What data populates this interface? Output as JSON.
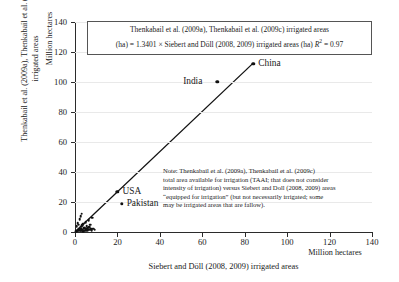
{
  "chart_data": {
    "type": "scatter",
    "title": "",
    "xlabel": "Siebert and Döll (2008, 2009) irrigated areas",
    "ylabel": "Thenkabail et al. (2009a), Thenkabail et al. (2009b) irrigated areas",
    "x_unit": "Million hectares",
    "y_unit": "Million hectares",
    "xlim": [
      0,
      140
    ],
    "ylim": [
      0,
      140
    ],
    "xticks": [
      0,
      20,
      40,
      60,
      80,
      100,
      120,
      140
    ],
    "yticks": [
      0,
      20,
      40,
      60,
      80,
      100,
      120,
      140
    ],
    "grid": "horizontal",
    "legend": "none",
    "regression": {
      "slope": 1.3401,
      "intercept": 0,
      "r_squared": 0.97,
      "line_from": [
        0,
        0
      ],
      "line_to": [
        84,
        112.6
      ]
    },
    "labeled_points": [
      {
        "name": "China",
        "x": 84,
        "y": 112,
        "label_side": "right"
      },
      {
        "name": "India",
        "x": 67,
        "y": 100,
        "label_side": "left"
      },
      {
        "name": "USA",
        "x": 20,
        "y": 27,
        "label_side": "right"
      },
      {
        "name": "Pakistan",
        "x": 22,
        "y": 19,
        "label_side": "right"
      }
    ],
    "unlabeled_points": [
      {
        "x": 1.0,
        "y": 1.0
      },
      {
        "x": 1.5,
        "y": 1.6
      },
      {
        "x": 2.0,
        "y": 2.2
      },
      {
        "x": 2.4,
        "y": 1.2
      },
      {
        "x": 2.8,
        "y": 3.4
      },
      {
        "x": 3.0,
        "y": 2.0
      },
      {
        "x": 3.4,
        "y": 4.6
      },
      {
        "x": 3.6,
        "y": 1.4
      },
      {
        "x": 4.0,
        "y": 5.4
      },
      {
        "x": 4.2,
        "y": 2.6
      },
      {
        "x": 4.6,
        "y": 3.0
      },
      {
        "x": 5.0,
        "y": 6.6
      },
      {
        "x": 5.2,
        "y": 1.8
      },
      {
        "x": 5.6,
        "y": 4.0
      },
      {
        "x": 6.0,
        "y": 2.4
      },
      {
        "x": 6.4,
        "y": 8.0
      },
      {
        "x": 6.8,
        "y": 3.2
      },
      {
        "x": 7.2,
        "y": 5.0
      },
      {
        "x": 7.6,
        "y": 2.0
      },
      {
        "x": 8.0,
        "y": 9.4
      },
      {
        "x": 2.2,
        "y": 8.4
      },
      {
        "x": 2.6,
        "y": 10.4
      },
      {
        "x": 3.2,
        "y": 12.2
      },
      {
        "x": 1.2,
        "y": 6.0
      },
      {
        "x": 0.8,
        "y": 3.8
      },
      {
        "x": 1.8,
        "y": 4.8
      },
      {
        "x": 4.8,
        "y": 1.0
      },
      {
        "x": 5.8,
        "y": 1.2
      },
      {
        "x": 6.6,
        "y": 1.6
      },
      {
        "x": 7.8,
        "y": 1.0
      },
      {
        "x": 8.6,
        "y": 2.2
      },
      {
        "x": 9.2,
        "y": 1.4
      },
      {
        "x": 0.5,
        "y": 0.6
      },
      {
        "x": 1.4,
        "y": 0.8
      },
      {
        "x": 2.9,
        "y": 0.9
      },
      {
        "x": 3.9,
        "y": 0.7
      }
    ]
  },
  "axes": {
    "y_title_line1": "Thenkabail et al. (2009a), Thenkabail et al. (2009b)",
    "y_title_line2": "irrigated areas",
    "y_unit_label": "Million hectares",
    "x_title": "Siebert and Döll (2008, 2009) irrigated areas",
    "x_unit_label": "Million hectares",
    "tick_labels": [
      "0",
      "20",
      "40",
      "60",
      "80",
      "100",
      "120",
      "140"
    ]
  },
  "equation_box": {
    "line1": "Thenkabail et al. (2009a), Thenkabail et al. (2009c) irrigated areas",
    "line2_a": "(ha) = 1.3401 × Siebert and Döll (2008, 2009) irrigated areas (ha) ",
    "line2_r": "R",
    "line2_sup": "2",
    "line2_b": " = 0.97"
  },
  "note_box": {
    "line1": "Note: Thenkabail et al. (2009a), Thenkabail et al. (2009c)",
    "line2": "total area available for irrigation (TAAI; that does not consider",
    "line3": "intensity of irrigation) versus Siebert and Doll (2008, 2009) areas",
    "line4": "“equipped for irrigation” (but not necessarily irrigated; some",
    "line5": "may be irrigated areas that are fallow)."
  },
  "point_labels": {
    "china": "China",
    "india": "India",
    "usa": "USA",
    "pakistan": "Pakistan"
  },
  "colors": {
    "marker": "#111111",
    "axis": "#2b2b2b",
    "grid": "#e9e9e9",
    "box_border": "#555555",
    "background": "#ffffff"
  }
}
